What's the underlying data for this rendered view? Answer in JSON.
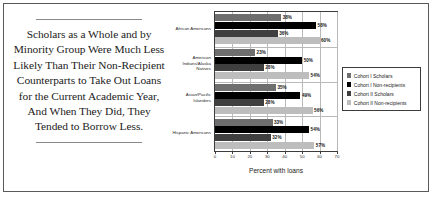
{
  "callout": {
    "quote": "Scholars as a Whole and by Minority Group Were Much Less Likely Than Their Non-Recipient Counterparts to Take Out Loans for the Current Academic Year, And When They Did, They Tended to Borrow Less."
  },
  "chart_data": {
    "type": "bar",
    "orientation": "horizontal",
    "title": "",
    "xlabel": "Percent with loans",
    "ylabel": "",
    "xlim": [
      0,
      70
    ],
    "xticks": [
      0,
      10,
      20,
      30,
      40,
      50,
      60,
      70
    ],
    "xtick_labels": [
      "0",
      "10",
      "20",
      "30",
      "40",
      "50",
      "60",
      "70"
    ],
    "grid": true,
    "legend_position": "right",
    "categories": [
      "African Americans",
      "American Indians/Alaska Natives",
      "Asian/Pacific Islanders",
      "Hispanic Americans"
    ],
    "series": [
      {
        "name": "Cohort I Scholars",
        "color": "#6e6e6e",
        "values": [
          38,
          23,
          35,
          33
        ],
        "labels": [
          "38%",
          "23%",
          "35%",
          "33%"
        ]
      },
      {
        "name": "Cohort I Non-recipients",
        "color": "#000000",
        "values": [
          58,
          50,
          49,
          54
        ],
        "labels": [
          "58%",
          "50%",
          "49%",
          "54%"
        ]
      },
      {
        "name": "Cohort II Scholars",
        "color": "#3f3f3f",
        "values": [
          36,
          28,
          28,
          32
        ],
        "labels": [
          "36%",
          "28%",
          "28%",
          "32%"
        ]
      },
      {
        "name": "Cohort II Non-recipients",
        "color": "#bdbdbd",
        "values": [
          60,
          54,
          56,
          57
        ],
        "labels": [
          "60%",
          "54%",
          "56%",
          "57%"
        ]
      }
    ]
  }
}
